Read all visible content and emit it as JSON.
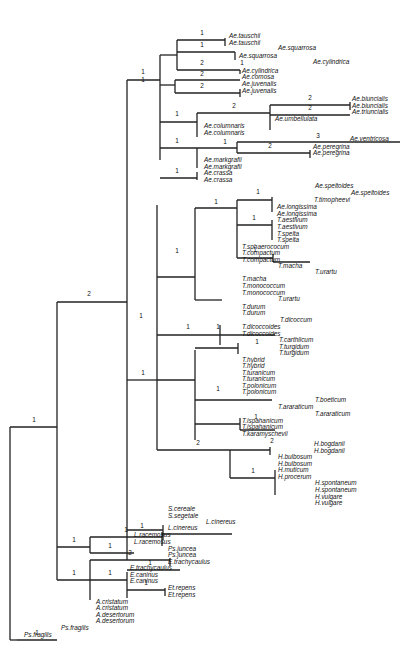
{
  "figure": {
    "type": "phylogenetic-tree",
    "line_color": "#222222",
    "background": "#ffffff"
  },
  "edges": [
    [
      10,
      640,
      10,
      427
    ],
    [
      10,
      427,
      57,
      427
    ],
    [
      10,
      640,
      17,
      640
    ],
    [
      17,
      640,
      57,
      640
    ],
    [
      57,
      302,
      57,
      580
    ],
    [
      57,
      302,
      127,
      302
    ],
    [
      57,
      580,
      57,
      580
    ],
    [
      127,
      80,
      127,
      560
    ],
    [
      127,
      80,
      160,
      80
    ],
    [
      160,
      55,
      160,
      160
    ],
    [
      160,
      55,
      177,
      55
    ],
    [
      177,
      40,
      177,
      70
    ],
    [
      177,
      40,
      225,
      40
    ],
    [
      225,
      38,
      225,
      46
    ],
    [
      177,
      52,
      235,
      52
    ],
    [
      235,
      52,
      235,
      60
    ],
    [
      177,
      70,
      240,
      70
    ],
    [
      240,
      70,
      240,
      74
    ],
    [
      160,
      85,
      175,
      85
    ],
    [
      175,
      80,
      175,
      93
    ],
    [
      175,
      80,
      240,
      80
    ],
    [
      175,
      93,
      240,
      93
    ],
    [
      240,
      89,
      240,
      97
    ],
    [
      160,
      122,
      197,
      122
    ],
    [
      197,
      113,
      197,
      137
    ],
    [
      197,
      113,
      270,
      113
    ],
    [
      270,
      105,
      270,
      130
    ],
    [
      270,
      105,
      350,
      105
    ],
    [
      350,
      102,
      350,
      110
    ],
    [
      270,
      115,
      350,
      115
    ],
    [
      160,
      148,
      197,
      148
    ],
    [
      197,
      148,
      197,
      168
    ],
    [
      197,
      148,
      237,
      148
    ],
    [
      237,
      142,
      237,
      153
    ],
    [
      237,
      142,
      400,
      142
    ],
    [
      237,
      153,
      310,
      153
    ],
    [
      310,
      150,
      310,
      158
    ],
    [
      160,
      178,
      197,
      178
    ],
    [
      197,
      172,
      197,
      180
    ],
    [
      127,
      380,
      157,
      380
    ],
    [
      157,
      205,
      157,
      450
    ],
    [
      157,
      277,
      195,
      277
    ],
    [
      195,
      208,
      195,
      300
    ],
    [
      195,
      208,
      237,
      208
    ],
    [
      237,
      200,
      237,
      258
    ],
    [
      237,
      200,
      272,
      200
    ],
    [
      272,
      197,
      272,
      212
    ],
    [
      237,
      225,
      272,
      225
    ],
    [
      272,
      220,
      272,
      240
    ],
    [
      237,
      258,
      273,
      258
    ],
    [
      273,
      254,
      273,
      262
    ],
    [
      273,
      262,
      310,
      262
    ],
    [
      195,
      300,
      222,
      300
    ],
    [
      157,
      335,
      220,
      335
    ],
    [
      220,
      325,
      220,
      345
    ],
    [
      220,
      335,
      275,
      335
    ],
    [
      157,
      380,
      195,
      380
    ],
    [
      195,
      350,
      195,
      440
    ],
    [
      195,
      348,
      238,
      348
    ],
    [
      238,
      343,
      238,
      354
    ],
    [
      195,
      400,
      272,
      400
    ],
    [
      195,
      424,
      240,
      424
    ],
    [
      240,
      418,
      240,
      430
    ],
    [
      240,
      430,
      275,
      430
    ],
    [
      157,
      450,
      230,
      450
    ],
    [
      230,
      450,
      230,
      478
    ],
    [
      230,
      450,
      270,
      450
    ],
    [
      270,
      447,
      270,
      455
    ],
    [
      230,
      478,
      275,
      478
    ],
    [
      275,
      470,
      275,
      495
    ],
    [
      127,
      530,
      163,
      530
    ],
    [
      163,
      525,
      163,
      540
    ],
    [
      57,
      547,
      90,
      547
    ],
    [
      90,
      537,
      90,
      553
    ],
    [
      90,
      537,
      162,
      537
    ],
    [
      162,
      532,
      162,
      546
    ],
    [
      162,
      534,
      232,
      534
    ],
    [
      90,
      553,
      134,
      553
    ],
    [
      57,
      580,
      90,
      580
    ],
    [
      90,
      560,
      90,
      600
    ],
    [
      90,
      560,
      170,
      560
    ],
    [
      170,
      558,
      170,
      566
    ],
    [
      90,
      580,
      127,
      580
    ],
    [
      127,
      572,
      127,
      598
    ],
    [
      127,
      570,
      180,
      570
    ],
    [
      127,
      590,
      165,
      590
    ],
    [
      165,
      588,
      165,
      596
    ]
  ],
  "supports": [
    {
      "x": 34,
      "y": 420,
      "v": "1"
    },
    {
      "x": 37,
      "y": 633,
      "v": "1"
    },
    {
      "x": 89,
      "y": 294,
      "v": "2"
    },
    {
      "x": 143,
      "y": 72,
      "v": "1"
    },
    {
      "x": 202,
      "y": 33,
      "v": "1"
    },
    {
      "x": 202,
      "y": 45,
      "v": "1"
    },
    {
      "x": 202,
      "y": 63,
      "v": "2"
    },
    {
      "x": 242,
      "y": 63,
      "v": "1"
    },
    {
      "x": 202,
      "y": 74,
      "v": "2"
    },
    {
      "x": 202,
      "y": 86,
      "v": "2"
    },
    {
      "x": 143,
      "y": 80,
      "v": "1"
    },
    {
      "x": 234,
      "y": 106,
      "v": "2"
    },
    {
      "x": 177,
      "y": 114,
      "v": "1"
    },
    {
      "x": 310,
      "y": 98,
      "v": "2"
    },
    {
      "x": 310,
      "y": 108,
      "v": "2"
    },
    {
      "x": 177,
      "y": 141,
      "v": "1"
    },
    {
      "x": 225,
      "y": 142,
      "v": "1"
    },
    {
      "x": 318,
      "y": 136,
      "v": "3"
    },
    {
      "x": 270,
      "y": 146,
      "v": "2"
    },
    {
      "x": 177,
      "y": 171,
      "v": "1"
    },
    {
      "x": 258,
      "y": 192,
      "v": "1"
    },
    {
      "x": 254,
      "y": 218,
      "v": "1"
    },
    {
      "x": 216,
      "y": 202,
      "v": "1"
    },
    {
      "x": 255,
      "y": 250,
      "v": "1"
    },
    {
      "x": 177,
      "y": 251,
      "v": "1"
    },
    {
      "x": 188,
      "y": 327,
      "v": "1"
    },
    {
      "x": 141,
      "y": 316,
      "v": "1"
    },
    {
      "x": 218,
      "y": 327,
      "v": "1"
    },
    {
      "x": 257,
      "y": 342,
      "v": "1"
    },
    {
      "x": 218,
      "y": 389,
      "v": "1"
    },
    {
      "x": 256,
      "y": 417,
      "v": "1"
    },
    {
      "x": 198,
      "y": 443,
      "v": "2"
    },
    {
      "x": 272,
      "y": 441,
      "v": "2"
    },
    {
      "x": 253,
      "y": 471,
      "v": "1"
    },
    {
      "x": 143,
      "y": 373,
      "v": "1"
    },
    {
      "x": 74,
      "y": 540,
      "v": "1"
    },
    {
      "x": 126,
      "y": 530,
      "v": "1"
    },
    {
      "x": 142,
      "y": 526,
      "v": "1"
    },
    {
      "x": 110,
      "y": 546,
      "v": "1"
    },
    {
      "x": 74,
      "y": 573,
      "v": "1"
    },
    {
      "x": 130,
      "y": 553,
      "v": "2"
    },
    {
      "x": 110,
      "y": 573,
      "v": "1"
    },
    {
      "x": 150,
      "y": 563,
      "v": "1"
    },
    {
      "x": 146,
      "y": 583,
      "v": "1"
    }
  ],
  "labels": [
    {
      "x": 229,
      "y": 36,
      "t": "Ae.tauschii"
    },
    {
      "x": 229,
      "y": 43,
      "t": "Ae.tauschii"
    },
    {
      "x": 278,
      "y": 48,
      "t": "Ae.squarrosa"
    },
    {
      "x": 239,
      "y": 56,
      "t": "Ae.squarrosa"
    },
    {
      "x": 313,
      "y": 62,
      "t": "Ae.cylindrica"
    },
    {
      "x": 242,
      "y": 71,
      "t": "Ae.cylindrica"
    },
    {
      "x": 242,
      "y": 77,
      "t": "Ae.comosa"
    },
    {
      "x": 242,
      "y": 84,
      "t": "Ae.juvenalis"
    },
    {
      "x": 242,
      "y": 91,
      "t": "Ae.juvenalis"
    },
    {
      "x": 352,
      "y": 99,
      "t": "Ae.biuncialis"
    },
    {
      "x": 352,
      "y": 106,
      "t": "Ae.biuncialis"
    },
    {
      "x": 352,
      "y": 112,
      "t": "Ae.triuncialis"
    },
    {
      "x": 275,
      "y": 119,
      "t": "Ae.umbellulata"
    },
    {
      "x": 204,
      "y": 126,
      "t": "Ae.columnaris"
    },
    {
      "x": 204,
      "y": 133,
      "t": "Ae.columnaris"
    },
    {
      "x": 350,
      "y": 139,
      "t": "Ae.ventricosa"
    },
    {
      "x": 313,
      "y": 147,
      "t": "Ae.peregrina"
    },
    {
      "x": 313,
      "y": 153,
      "t": "Ae.peregrina"
    },
    {
      "x": 204,
      "y": 160,
      "t": "Ae.markgrafii"
    },
    {
      "x": 204,
      "y": 167,
      "t": "Ae.markgrafii"
    },
    {
      "x": 204,
      "y": 173,
      "t": "Ae.crassa"
    },
    {
      "x": 204,
      "y": 180,
      "t": "Ae.crassa"
    },
    {
      "x": 315,
      "y": 186,
      "t": "Ae.speltoides"
    },
    {
      "x": 351,
      "y": 193,
      "t": "Ae.speltoides"
    },
    {
      "x": 314,
      "y": 200,
      "t": "T.timopheevi"
    },
    {
      "x": 277,
      "y": 207,
      "t": "Ae.longissima"
    },
    {
      "x": 277,
      "y": 214,
      "t": "Ae.longissima"
    },
    {
      "x": 277,
      "y": 220,
      "t": "T.aestivum"
    },
    {
      "x": 277,
      "y": 227,
      "t": "T.aestivum"
    },
    {
      "x": 277,
      "y": 234,
      "t": "T.spelta"
    },
    {
      "x": 277,
      "y": 240,
      "t": "T.spelta"
    },
    {
      "x": 242,
      "y": 247,
      "t": "T.sphaerococum"
    },
    {
      "x": 242,
      "y": 253,
      "t": "T.compactum"
    },
    {
      "x": 242,
      "y": 260,
      "t": "T.compactum"
    },
    {
      "x": 278,
      "y": 266,
      "t": "T.macha"
    },
    {
      "x": 315,
      "y": 272,
      "t": "T.urartu"
    },
    {
      "x": 242,
      "y": 279,
      "t": "T.macha"
    },
    {
      "x": 242,
      "y": 286,
      "t": "T.monococcum"
    },
    {
      "x": 242,
      "y": 293,
      "t": "T.monococcum"
    },
    {
      "x": 278,
      "y": 299,
      "t": "T.urartu"
    },
    {
      "x": 242,
      "y": 307,
      "t": "T.durum"
    },
    {
      "x": 242,
      "y": 313,
      "t": "T.durum"
    },
    {
      "x": 280,
      "y": 320,
      "t": "T.dicoccum"
    },
    {
      "x": 242,
      "y": 327,
      "t": "T.dicoccoides"
    },
    {
      "x": 242,
      "y": 334,
      "t": "T.dicoccoides"
    },
    {
      "x": 279,
      "y": 340,
      "t": "T.carthlicum"
    },
    {
      "x": 279,
      "y": 347,
      "t": "T.turgidum"
    },
    {
      "x": 279,
      "y": 353,
      "t": "T.turgidum"
    },
    {
      "x": 242,
      "y": 360,
      "t": "T.hybrid"
    },
    {
      "x": 242,
      "y": 366,
      "t": "T.hybrid"
    },
    {
      "x": 242,
      "y": 373,
      "t": "T.turanicum"
    },
    {
      "x": 242,
      "y": 379,
      "t": "T.turanicum"
    },
    {
      "x": 242,
      "y": 386,
      "t": "T.polonicum"
    },
    {
      "x": 242,
      "y": 392,
      "t": "T.polonicum"
    },
    {
      "x": 315,
      "y": 400,
      "t": "T.boeticum"
    },
    {
      "x": 278,
      "y": 407,
      "t": "T.araraticum"
    },
    {
      "x": 315,
      "y": 414,
      "t": "T.araraticum"
    },
    {
      "x": 242,
      "y": 421,
      "t": "T.ispahanicum"
    },
    {
      "x": 242,
      "y": 427,
      "t": "T.ispahanicum"
    },
    {
      "x": 242,
      "y": 434,
      "t": "T.karamyschevii"
    },
    {
      "x": 314,
      "y": 444,
      "t": "H.bogdanii"
    },
    {
      "x": 314,
      "y": 451,
      "t": "H.bogdanii"
    },
    {
      "x": 278,
      "y": 457,
      "t": "H.bulbosum"
    },
    {
      "x": 278,
      "y": 464,
      "t": "H.bulbosum"
    },
    {
      "x": 278,
      "y": 470,
      "t": "H.muticum"
    },
    {
      "x": 278,
      "y": 477,
      "t": "H.procerum"
    },
    {
      "x": 315,
      "y": 483,
      "t": "H.spontaneum"
    },
    {
      "x": 315,
      "y": 490,
      "t": "H.spontaneum"
    },
    {
      "x": 315,
      "y": 497,
      "t": "H.vulgare"
    },
    {
      "x": 315,
      "y": 503,
      "t": "H.vulgare"
    },
    {
      "x": 168,
      "y": 509,
      "t": "S.cereale"
    },
    {
      "x": 168,
      "y": 516,
      "t": "S.segetale"
    },
    {
      "x": 206,
      "y": 522,
      "t": "L.cinereus"
    },
    {
      "x": 168,
      "y": 528,
      "t": "L.cinereus"
    },
    {
      "x": 134,
      "y": 535,
      "t": "L.racemosus"
    },
    {
      "x": 134,
      "y": 542,
      "t": "L.racemosus"
    },
    {
      "x": 168,
      "y": 549,
      "t": "Ps.juncea"
    },
    {
      "x": 168,
      "y": 555,
      "t": "Ps.juncea"
    },
    {
      "x": 168,
      "y": 562,
      "t": "E.trachycaulus"
    },
    {
      "x": 130,
      "y": 568,
      "t": "E.trachycaulus"
    },
    {
      "x": 130,
      "y": 575,
      "t": "E.caninus"
    },
    {
      "x": 130,
      "y": 581,
      "t": "E.caninus"
    },
    {
      "x": 168,
      "y": 588,
      "t": "Et.repens"
    },
    {
      "x": 168,
      "y": 595,
      "t": "Et.repens"
    },
    {
      "x": 96,
      "y": 602,
      "t": "A.cristatum"
    },
    {
      "x": 96,
      "y": 608,
      "t": "A.cristatum"
    },
    {
      "x": 96,
      "y": 615,
      "t": "A.desertorum"
    },
    {
      "x": 96,
      "y": 621,
      "t": "A.desertorum"
    },
    {
      "x": 61,
      "y": 628,
      "t": "Ps.fragilis"
    },
    {
      "x": 24,
      "y": 635,
      "t": "Ps.fragilis"
    }
  ]
}
